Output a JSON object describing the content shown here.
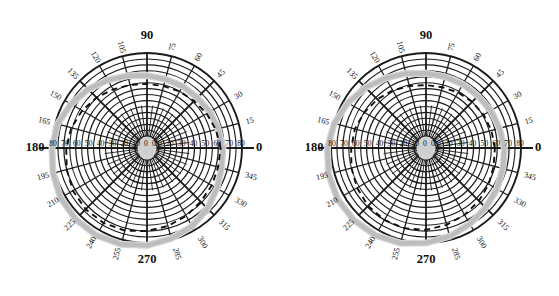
{
  "figure": {
    "title": "",
    "panel_count": 2
  },
  "chart_data": [
    {
      "type": "line",
      "plot_kind": "polar",
      "panel": "left",
      "title": "",
      "xlabel": "",
      "ylabel": "",
      "grid": true,
      "legend": "none",
      "angular_unit": "degrees",
      "angular_range": [
        0,
        360
      ],
      "angular_tick_step": 15,
      "angular_ticks": [
        0,
        15,
        30,
        45,
        60,
        75,
        90,
        105,
        120,
        135,
        150,
        165,
        180,
        195,
        210,
        225,
        240,
        255,
        270,
        285,
        300,
        315,
        330,
        345
      ],
      "angular_tick_labels": [
        "0",
        "15",
        "30",
        "45",
        "60",
        "75",
        "90",
        "105",
        "120",
        "135",
        "150",
        "165",
        "180",
        "195",
        "210",
        "225",
        "240",
        "255",
        "270",
        "285",
        "300",
        "315",
        "330",
        "345"
      ],
      "cardinal_labels": [
        "0",
        "90",
        "180",
        "270"
      ],
      "radial_range": [
        0,
        80
      ],
      "radial_tick_step": 10,
      "radial_ticks": [
        0,
        10,
        20,
        30,
        40,
        50,
        60,
        70,
        80
      ],
      "radial_axis_labels_right": [
        "0",
        "10",
        "20",
        "30",
        "40",
        "50",
        "60",
        "70",
        "80"
      ],
      "radial_axis_labels_left": [
        "0",
        "10",
        "20",
        "30",
        "40",
        "50",
        "60",
        "70",
        "80"
      ],
      "series": [
        {
          "name": "dashed-contour",
          "style": "dashed",
          "color": "#111111",
          "theta": [
            0,
            15,
            30,
            45,
            60,
            75,
            90,
            105,
            120,
            135,
            150,
            165,
            180,
            195,
            210,
            225,
            240,
            255,
            270,
            285,
            300,
            315,
            330,
            345,
            360
          ],
          "r": [
            62,
            60,
            58,
            56,
            55,
            54,
            54,
            55,
            57,
            60,
            63,
            66,
            68,
            70,
            72,
            73,
            73,
            72,
            70,
            68,
            66,
            64,
            63,
            62,
            62
          ]
        },
        {
          "name": "gray-contour",
          "style": "solid",
          "color": "#bdbdbd",
          "theta": [
            0,
            15,
            30,
            45,
            60,
            75,
            90,
            105,
            120,
            135,
            150,
            165,
            180,
            195,
            210,
            225,
            240,
            255,
            270,
            285,
            300,
            315,
            330,
            345,
            360
          ],
          "r": [
            64,
            62,
            61,
            60,
            60,
            60,
            61,
            63,
            66,
            70,
            74,
            78,
            80,
            82,
            84,
            85,
            85,
            84,
            82,
            79,
            76,
            72,
            68,
            65,
            64
          ]
        }
      ],
      "center_marker": {
        "shape": "oval",
        "color": "#cfcfcf"
      }
    },
    {
      "type": "line",
      "plot_kind": "polar",
      "panel": "right",
      "title": "",
      "xlabel": "",
      "ylabel": "",
      "grid": true,
      "legend": "none",
      "angular_unit": "degrees",
      "angular_range": [
        0,
        360
      ],
      "angular_tick_step": 15,
      "angular_ticks": [
        0,
        15,
        30,
        45,
        60,
        75,
        90,
        105,
        120,
        135,
        150,
        165,
        180,
        195,
        210,
        225,
        240,
        255,
        270,
        285,
        300,
        315,
        330,
        345
      ],
      "angular_tick_labels": [
        "0",
        "15",
        "30",
        "45",
        "60",
        "75",
        "90",
        "105",
        "120",
        "135",
        "150",
        "165",
        "180",
        "195",
        "210",
        "225",
        "240",
        "255",
        "270",
        "285",
        "300",
        "315",
        "330",
        "345"
      ],
      "cardinal_labels": [
        "0",
        "90",
        "180",
        "270"
      ],
      "radial_range": [
        0,
        80
      ],
      "radial_tick_step": 10,
      "radial_ticks": [
        0,
        10,
        20,
        30,
        40,
        50,
        60,
        70,
        80
      ],
      "radial_axis_labels_right": [
        "0",
        "10",
        "20",
        "30",
        "40",
        "50",
        "60",
        "70",
        "80"
      ],
      "radial_axis_labels_left": [
        "0",
        "10",
        "20",
        "30",
        "40",
        "50",
        "60",
        "70",
        "80"
      ],
      "series": [
        {
          "name": "dashed-contour",
          "style": "dashed",
          "color": "#111111",
          "theta": [
            0,
            15,
            30,
            45,
            60,
            75,
            90,
            105,
            120,
            135,
            150,
            165,
            180,
            195,
            210,
            225,
            240,
            255,
            270,
            285,
            300,
            315,
            330,
            345,
            360
          ],
          "r": [
            58,
            57,
            56,
            55,
            54,
            53,
            53,
            54,
            56,
            58,
            60,
            62,
            63,
            65,
            67,
            69,
            70,
            70,
            69,
            67,
            65,
            63,
            61,
            59,
            58
          ]
        },
        {
          "name": "gray-contour",
          "style": "solid",
          "color": "#bdbdbd",
          "theta": [
            0,
            15,
            30,
            45,
            60,
            75,
            90,
            105,
            120,
            135,
            150,
            165,
            180,
            195,
            210,
            225,
            240,
            255,
            270,
            285,
            300,
            315,
            330,
            345,
            360
          ],
          "r": [
            66,
            64,
            63,
            62,
            62,
            62,
            63,
            65,
            68,
            72,
            76,
            80,
            83,
            85,
            86,
            86,
            85,
            83,
            80,
            77,
            74,
            71,
            69,
            67,
            66
          ]
        }
      ],
      "center_marker": {
        "shape": "oval",
        "color": "#cfcfcf"
      }
    }
  ],
  "colors": {
    "grid": "#1a1a1a",
    "background": "#ffffff",
    "dashed_series": "#111111",
    "gray_series": "#bdbdbd",
    "hub": "#cfcfcf"
  }
}
